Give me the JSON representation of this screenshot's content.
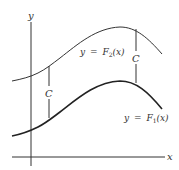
{
  "figure": {
    "axes": {
      "x_label": "x",
      "y_label": "y"
    },
    "curves": [
      {
        "id": "upper",
        "label_lhs": "y",
        "label_eq": "=",
        "label_fn": "F",
        "label_sub": "2",
        "label_arg": "(x)"
      },
      {
        "id": "lower",
        "label_lhs": "y",
        "label_eq": "=",
        "label_fn": "F",
        "label_sub": "1",
        "label_arg": "(x)"
      }
    ],
    "offsets": [
      {
        "label": "C"
      },
      {
        "label": "C"
      }
    ],
    "colors": {
      "line": "#2a2a2a",
      "text": "#333333",
      "background": "#ffffff"
    }
  }
}
